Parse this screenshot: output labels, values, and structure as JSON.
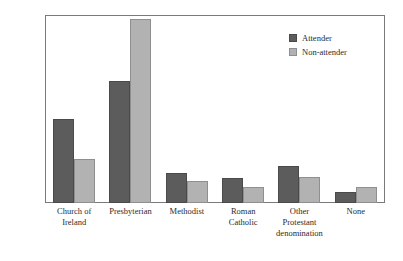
{
  "chart_data": {
    "type": "bar",
    "title": "",
    "subtitle": "",
    "xlabel": "",
    "ylabel": "",
    "ylim": [
      0,
      60
    ],
    "yticks": [
      0,
      10,
      20,
      30,
      40,
      50,
      60
    ],
    "ytick_labels": [
      "0%",
      "10%",
      "20%",
      "30%",
      "40%",
      "50%",
      "60%"
    ],
    "grid": false,
    "legend_position": "top-right",
    "categories": [
      "Church of Ireland",
      "Presbyterian",
      "Methodist",
      "Roman Catholic",
      "Other Protestant denomination",
      "None"
    ],
    "category_label_lines": [
      [
        "Church of",
        "Ireland"
      ],
      [
        "Presbyterian"
      ],
      [
        "Methodist"
      ],
      [
        "Roman",
        "Catholic"
      ],
      [
        "Other",
        "Protestant",
        "denomination"
      ],
      [
        "None"
      ]
    ],
    "series": [
      {
        "name": "Attender",
        "color": "#5c5c5c",
        "values": [
          27,
          39,
          9.5,
          8,
          12,
          3.5
        ]
      },
      {
        "name": "Non-attender",
        "color": "#b2b2b2",
        "values": [
          14,
          59,
          7,
          5,
          8.5,
          5
        ]
      }
    ]
  },
  "legend": {
    "items": [
      {
        "label": "Attender",
        "swatch": "attender-swatch"
      },
      {
        "label": "Non-attender",
        "swatch": "non-attender-swatch"
      }
    ]
  },
  "colors": {
    "attender": "#5c5c5c",
    "non_attender": "#b2b2b2",
    "axis": "#7a7a7a",
    "text": "#2b2b2b",
    "background": "#ffffff"
  }
}
